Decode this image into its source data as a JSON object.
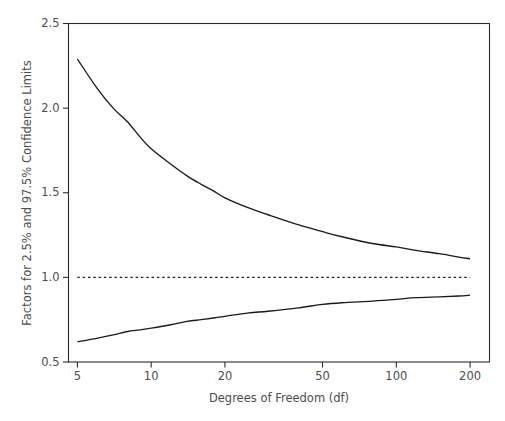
{
  "chart_data": {
    "type": "line",
    "title": "",
    "subtitle": "",
    "xlabel": "Degrees of Freedom (df)",
    "ylabel": "Factors for 2.5% and 97.5% Confidence Limits",
    "xscale": "log",
    "yscale": "linear",
    "xlim": [
      4.6,
      240
    ],
    "ylim": [
      0.5,
      2.5
    ],
    "xticks": [
      5,
      10,
      20,
      50,
      100,
      200
    ],
    "xticklabels": [
      "5",
      "10",
      "20",
      "50",
      "100",
      "200"
    ],
    "yticks": [
      0.5,
      1.0,
      1.5,
      2.0,
      2.5
    ],
    "yticklabels": [
      "0.5",
      "1.0",
      "1.5",
      "2.0",
      "2.5"
    ],
    "grid": false,
    "legend": "none",
    "frame": true,
    "series": [
      {
        "name": "Upper factor (97.5% confidence limit)",
        "style": "solid",
        "color": "#1a1a1a",
        "x": [
          5,
          6,
          7,
          8,
          9,
          10,
          12,
          14,
          16,
          18,
          20,
          25,
          30,
          40,
          50,
          60,
          80,
          100,
          120,
          150,
          180,
          200
        ],
        "values": [
          2.29,
          2.12,
          2.0,
          1.92,
          1.83,
          1.76,
          1.67,
          1.6,
          1.55,
          1.51,
          1.47,
          1.41,
          1.37,
          1.31,
          1.27,
          1.24,
          1.2,
          1.18,
          1.16,
          1.14,
          1.12,
          1.11
        ]
      },
      {
        "name": "Lower factor (2.5% confidence limit)",
        "style": "solid",
        "color": "#1a1a1a",
        "x": [
          5,
          6,
          7,
          8,
          9,
          10,
          12,
          14,
          16,
          18,
          20,
          25,
          30,
          40,
          50,
          60,
          80,
          100,
          120,
          150,
          180,
          200
        ],
        "values": [
          0.62,
          0.64,
          0.66,
          0.68,
          0.69,
          0.7,
          0.72,
          0.74,
          0.75,
          0.76,
          0.77,
          0.79,
          0.8,
          0.82,
          0.84,
          0.85,
          0.86,
          0.87,
          0.88,
          0.885,
          0.89,
          0.895
        ]
      },
      {
        "name": "Reference line at 1.0",
        "style": "dotted",
        "color": "#1a1a1a",
        "x": [
          5,
          200
        ],
        "values": [
          1.0,
          1.0
        ]
      }
    ],
    "annotations": []
  }
}
